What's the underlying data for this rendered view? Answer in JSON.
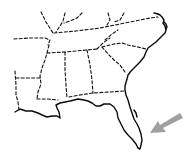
{
  "map": {
    "title": "Southeastern United States outline map",
    "region": "Southeastern United States",
    "style": "line drawing with dashed state borders and solid coastline",
    "highlight": {
      "marker": "arrow",
      "target": "Southeast Florida coast",
      "color": "#a0a0a0"
    },
    "colors": {
      "background": "#ffffff",
      "lines": "#111111",
      "arrow": "#a0a0a0"
    }
  }
}
